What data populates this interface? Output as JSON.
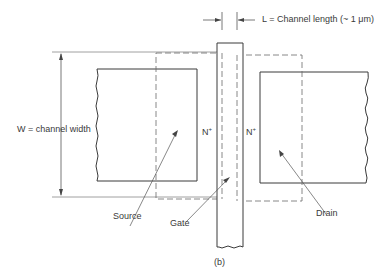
{
  "diagram": {
    "caption": "(b)",
    "channel_length_label": "L = Channel length (~ 1 μm)",
    "channel_width_label": "W = channel width",
    "regions": {
      "source": {
        "label": "Source",
        "doping": "N",
        "doping_sup": "+"
      },
      "drain": {
        "label": "Drain",
        "doping": "N",
        "doping_sup": "+"
      },
      "gate": {
        "label": "Gate"
      }
    },
    "colors": {
      "line": "#3a3a3a",
      "dashed": "#6a6a6a",
      "background": "#ffffff"
    }
  }
}
